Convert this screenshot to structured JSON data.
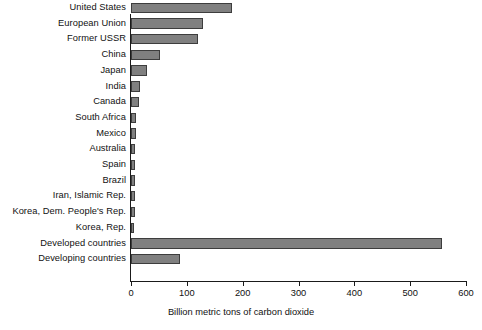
{
  "chart_data": {
    "type": "bar",
    "orientation": "horizontal",
    "title": "",
    "xlabel": "Billion metric tons of carbon dioxide",
    "ylabel": "",
    "xlim": [
      0,
      600
    ],
    "xticks": [
      0,
      100,
      200,
      300,
      400,
      500,
      600
    ],
    "xtick_labels": [
      "0",
      "100",
      "200",
      "300",
      "400",
      "500",
      "600"
    ],
    "grid": false,
    "legend": null,
    "bar_color": "#808080",
    "bar_border_color": "#3d3d3d",
    "axis_color": "#1a1a1a",
    "categories": [
      "United States",
      "European Union",
      "Former USSR",
      "China",
      "Japan",
      "India",
      "Canada",
      "South Africa",
      "Mexico",
      "Australia",
      "Spain",
      "Brazil",
      "Iran, Islamic Rep.",
      "Korea, Dem. People's Rep.",
      "Korea, Rep.",
      "Developed countries",
      "Developing countries"
    ],
    "values": [
      181,
      129,
      120,
      52,
      29,
      16,
      15,
      9,
      9,
      8,
      8,
      8,
      7,
      7,
      6,
      557,
      88
    ]
  }
}
